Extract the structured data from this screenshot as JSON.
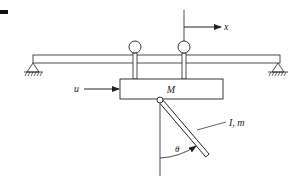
{
  "diagram": {
    "type": "inverted-pendulum-on-cart",
    "labels": {
      "cart_mass": "M",
      "force": "u",
      "position": "x",
      "pendulum": "I, m",
      "angle": "θ"
    },
    "colors": {
      "stroke": "#222222",
      "background": "#ffffff",
      "fill": "#ffffff"
    },
    "components": [
      {
        "name": "track",
        "description": "horizontal rail supported by two pin supports"
      },
      {
        "name": "left-support",
        "description": "triangular pin support with ground hatching"
      },
      {
        "name": "right-support",
        "description": "triangular pin support with ground hatching"
      },
      {
        "name": "wheels",
        "count": 2
      },
      {
        "name": "cart",
        "label": "M"
      },
      {
        "name": "force-arrow",
        "label": "u"
      },
      {
        "name": "position-axis",
        "label": "x"
      },
      {
        "name": "pendulum-rod",
        "label": "I, m"
      },
      {
        "name": "angle-arc",
        "label": "θ"
      }
    ]
  }
}
